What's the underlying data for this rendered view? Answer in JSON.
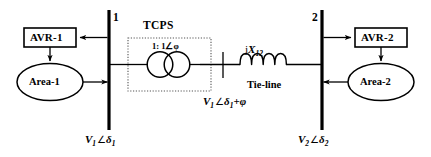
{
  "diagram": {
    "buses": [
      {
        "number": "1",
        "voltage_label_parts": {
          "v": "V",
          "vsub": "1",
          "angle": "∠",
          "delta": "δ",
          "dsub": "1",
          "extra": ""
        }
      },
      {
        "number": "2",
        "voltage_label_parts": {
          "v": "V",
          "vsub": "2",
          "angle": "∠",
          "delta": "δ",
          "dsub": "2",
          "extra": ""
        }
      }
    ],
    "bus1_number": "1",
    "bus2_number": "2",
    "avr1_label": "AVR-1",
    "avr2_label": "AVR-2",
    "area1_label": "Area-1",
    "area2_label": "Area-2",
    "tcps_title": "TCPS",
    "tcps_ratio": "1: 1∠φ",
    "tie_line_label": "Tie-line",
    "reactance": {
      "j": "j",
      "x": "X",
      "sub": "12"
    },
    "bus1_voltage": {
      "v": "V",
      "vsub": "1",
      "angle": "∠",
      "delta": "δ",
      "dsub": "1"
    },
    "bus2_voltage": {
      "v": "V",
      "vsub": "2",
      "angle": "∠",
      "delta": "δ",
      "dsub": "2"
    },
    "tcps_output_voltage": {
      "v": "V",
      "vsub": "1",
      "angle": "∠",
      "delta": "δ",
      "dsub": "1",
      "plus": "+",
      "phi": "φ"
    },
    "colors": {
      "line": "#000000",
      "background": "#ffffff",
      "dotted_box": "#555555"
    }
  }
}
